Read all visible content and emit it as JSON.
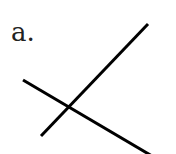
{
  "diagram": {
    "label": "a.",
    "stroke_color": "#000000",
    "stroke_width": 3,
    "lines": [
      {
        "name": "line-rising",
        "x1": 41,
        "y1": 136,
        "x2": 148,
        "y2": 24
      },
      {
        "name": "line-falling",
        "x1": 23,
        "y1": 80,
        "x2": 152,
        "y2": 156
      }
    ]
  }
}
